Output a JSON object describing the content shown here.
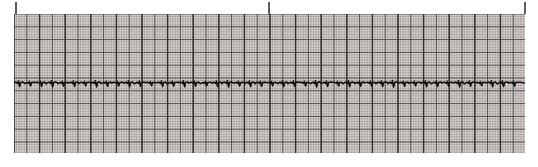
{
  "figure": {
    "background_color": "#ffffff",
    "width": 538,
    "height": 167
  },
  "ticks": {
    "name": "time-marker-ticks",
    "color": "#5a5a5a",
    "y": 2,
    "height": 12,
    "positions": [
      15,
      268,
      524
    ],
    "labels": [
      "",
      "",
      ""
    ]
  },
  "grid": {
    "x": 14,
    "y": 14,
    "width": 511,
    "height": 139,
    "paper_color": "#d9d4d2",
    "minor_color": "#8e8a88",
    "major_color": "#4a4744",
    "heavy_color": "#2e2c2a",
    "minor_step": 2.56,
    "major_step": 12.8,
    "heavy_step": 25.6,
    "minor_width": 0.6,
    "major_width": 1.0,
    "heavy_width": 1.4
  },
  "trace": {
    "name": "ecg-waveform",
    "color": "#101010",
    "line_width": 1.6,
    "baseline_y": 83,
    "lead_label": "",
    "amplitude_note": "compressed low-amplitude rhythm strip"
  },
  "chart_data": {
    "type": "line",
    "subtitle": "",
    "xlabel": "Time",
    "ylabel": "Amplitude (mV)",
    "grid": true,
    "legend_position": "none",
    "x_unit": "s",
    "y_unit": "mV",
    "paper_speed_mm_per_s": 25,
    "gain_mm_per_mV": 10,
    "xlim": [
      0,
      51.1
    ],
    "ylim": [
      -1.0,
      1.0
    ],
    "annotations": [
      {
        "name": "tick-left",
        "x_px": 15,
        "label": ""
      },
      {
        "name": "tick-middle",
        "x_px": 268,
        "label": ""
      },
      {
        "name": "tick-right",
        "x_px": 524,
        "label": ""
      }
    ],
    "series": [
      {
        "name": "Lead II",
        "color": "#101010",
        "beat_count": 46,
        "mean_rr_px": 11.0,
        "baseline_px": 83,
        "beats": [
          {
            "x": 19,
            "q": 1.5,
            "r": -2.0,
            "s": 3.5,
            "t": -1.0
          },
          {
            "x": 30,
            "q": 1.2,
            "r": -1.6,
            "s": 3.0,
            "t": -0.8
          },
          {
            "x": 41,
            "q": 1.4,
            "r": -1.8,
            "s": 3.2,
            "t": -0.9
          },
          {
            "x": 52,
            "q": 1.6,
            "r": -2.2,
            "s": 3.8,
            "t": -1.1
          },
          {
            "x": 63,
            "q": 1.3,
            "r": -1.7,
            "s": 3.1,
            "t": -0.8
          },
          {
            "x": 74,
            "q": 1.5,
            "r": -2.0,
            "s": 3.4,
            "t": -1.0
          },
          {
            "x": 85,
            "q": 1.2,
            "r": -1.5,
            "s": 2.9,
            "t": -0.7
          },
          {
            "x": 96,
            "q": 1.7,
            "r": -2.3,
            "s": 3.9,
            "t": -1.2
          },
          {
            "x": 107,
            "q": 1.4,
            "r": -1.8,
            "s": 3.3,
            "t": -0.9
          },
          {
            "x": 118,
            "q": 1.3,
            "r": -1.6,
            "s": 3.0,
            "t": -0.8
          },
          {
            "x": 129,
            "q": 1.6,
            "r": -2.1,
            "s": 3.6,
            "t": -1.0
          },
          {
            "x": 140,
            "q": 1.4,
            "r": -1.9,
            "s": 3.2,
            "t": -0.9
          },
          {
            "x": 151,
            "q": 1.2,
            "r": -1.5,
            "s": 2.8,
            "t": -0.7
          },
          {
            "x": 162,
            "q": 1.5,
            "r": -2.0,
            "s": 3.5,
            "t": -1.0
          },
          {
            "x": 173,
            "q": 1.3,
            "r": -1.7,
            "s": 3.1,
            "t": -0.8
          },
          {
            "x": 184,
            "q": 1.6,
            "r": -2.2,
            "s": 3.7,
            "t": -1.1
          },
          {
            "x": 195,
            "q": 1.4,
            "r": -1.8,
            "s": 3.2,
            "t": -0.9
          },
          {
            "x": 206,
            "q": 1.2,
            "r": -1.6,
            "s": 2.9,
            "t": -0.7
          },
          {
            "x": 217,
            "q": 1.5,
            "r": -2.0,
            "s": 3.4,
            "t": -1.0
          },
          {
            "x": 228,
            "q": 1.7,
            "r": -2.4,
            "s": 4.0,
            "t": -1.2
          },
          {
            "x": 239,
            "q": 1.3,
            "r": -1.7,
            "s": 3.0,
            "t": -0.8
          },
          {
            "x": 250,
            "q": 1.5,
            "r": -2.0,
            "s": 3.5,
            "t": -1.0
          },
          {
            "x": 261,
            "q": 1.4,
            "r": -1.8,
            "s": 3.2,
            "t": -0.9
          },
          {
            "x": 272,
            "q": 1.2,
            "r": -1.5,
            "s": 2.8,
            "t": -0.7
          },
          {
            "x": 283,
            "q": 1.6,
            "r": -2.1,
            "s": 3.6,
            "t": -1.0
          },
          {
            "x": 294,
            "q": 1.4,
            "r": -1.9,
            "s": 3.3,
            "t": -0.9
          },
          {
            "x": 305,
            "q": 1.3,
            "r": -1.6,
            "s": 3.0,
            "t": -0.8
          },
          {
            "x": 316,
            "q": 1.7,
            "r": -2.3,
            "s": 3.9,
            "t": -1.2
          },
          {
            "x": 327,
            "q": 1.5,
            "r": -2.0,
            "s": 3.4,
            "t": -1.0
          },
          {
            "x": 338,
            "q": 1.2,
            "r": -1.5,
            "s": 2.9,
            "t": -0.7
          },
          {
            "x": 349,
            "q": 1.6,
            "r": -2.2,
            "s": 3.7,
            "t": -1.1
          },
          {
            "x": 360,
            "q": 1.4,
            "r": -1.8,
            "s": 3.2,
            "t": -0.9
          },
          {
            "x": 371,
            "q": 1.3,
            "r": -1.7,
            "s": 3.1,
            "t": -0.8
          },
          {
            "x": 382,
            "q": 1.5,
            "r": -2.0,
            "s": 3.5,
            "t": -1.0
          },
          {
            "x": 393,
            "q": 1.7,
            "r": -2.4,
            "s": 4.0,
            "t": -1.2
          },
          {
            "x": 404,
            "q": 1.4,
            "r": -1.8,
            "s": 3.3,
            "t": -0.9
          },
          {
            "x": 415,
            "q": 1.2,
            "r": -1.6,
            "s": 2.9,
            "t": -0.7
          },
          {
            "x": 426,
            "q": 1.6,
            "r": -2.1,
            "s": 3.6,
            "t": -1.0
          },
          {
            "x": 437,
            "q": 1.5,
            "r": -2.0,
            "s": 3.4,
            "t": -1.0
          },
          {
            "x": 448,
            "q": 1.3,
            "r": -1.7,
            "s": 3.0,
            "t": -0.8
          },
          {
            "x": 459,
            "q": 1.7,
            "r": -2.3,
            "s": 3.9,
            "t": -1.2
          },
          {
            "x": 470,
            "q": 1.4,
            "r": -1.9,
            "s": 3.3,
            "t": -0.9
          },
          {
            "x": 481,
            "q": 1.2,
            "r": -1.5,
            "s": 2.8,
            "t": -0.7
          },
          {
            "x": 492,
            "q": 1.6,
            "r": -2.2,
            "s": 3.7,
            "t": -1.1
          },
          {
            "x": 503,
            "q": 1.5,
            "r": -2.0,
            "s": 3.5,
            "t": -1.0
          },
          {
            "x": 514,
            "q": 1.3,
            "r": -1.7,
            "s": 3.1,
            "t": -0.8
          }
        ]
      }
    ]
  }
}
